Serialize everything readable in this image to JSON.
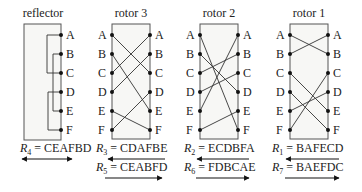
{
  "letters": [
    "A",
    "B",
    "C",
    "D",
    "E",
    "F"
  ],
  "components": [
    {
      "id": "reflector",
      "title": "reflector",
      "mapping": "CEAFBD",
      "pairs": [
        [
          "A",
          "C"
        ],
        [
          "B",
          "E"
        ],
        [
          "D",
          "F"
        ]
      ],
      "labels": [
        {
          "var": "R",
          "sub": "4",
          "value": "CEAFBD",
          "text": " = CEAFBD",
          "direction": "both"
        }
      ]
    },
    {
      "id": "rotor-3",
      "title": "rotor 3",
      "labels": [
        {
          "var": "R",
          "sub": "3",
          "value": "CDAFBE",
          "text": " = CDAFBE",
          "direction": "left"
        },
        {
          "var": "R",
          "sub": "5",
          "value": "CEABFD",
          "text": " = CEABFD",
          "direction": "right"
        }
      ]
    },
    {
      "id": "rotor-2",
      "title": "rotor 2",
      "labels": [
        {
          "var": "R",
          "sub": "2",
          "value": "ECDBFA",
          "text": " = ECDBFA",
          "direction": "left"
        },
        {
          "var": "R",
          "sub": "6",
          "value": "FDBCAE",
          "text": " = FDBCAE",
          "direction": "right"
        }
      ]
    },
    {
      "id": "rotor-1",
      "title": "rotor 1",
      "labels": [
        {
          "var": "R",
          "sub": "1",
          "value": "BAFECD",
          "text": " = BAFECD",
          "direction": "left"
        },
        {
          "var": "R",
          "sub": "7",
          "value": "BAEFDC",
          "text": " = BAEFDC",
          "direction": "right"
        }
      ]
    }
  ],
  "colors": {
    "box_fill": "#f7f7f5",
    "box_stroke": "#555555",
    "wire": "#333333",
    "text": "#222222"
  }
}
